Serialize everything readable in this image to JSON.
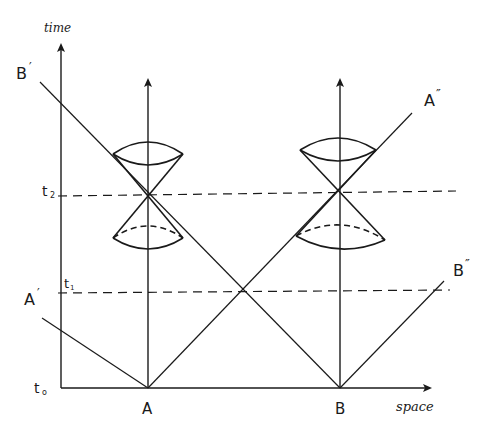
{
  "diagram": {
    "axes": {
      "time_label": "time",
      "space_label": "space"
    },
    "time_ticks": [
      {
        "label": "t",
        "sub": "o",
        "y": 388
      },
      {
        "label": "t",
        "sub": "1",
        "y": 293
      },
      {
        "label": "t",
        "sub": "2",
        "y": 196
      }
    ],
    "points": [
      {
        "label": "A",
        "x": 148
      },
      {
        "label": "B",
        "x": 340
      }
    ],
    "ray_labels": {
      "b_prime": "B",
      "b_prime_mark": "′",
      "a_prime": "A",
      "a_prime_mark": "′",
      "a_double_prime": "A",
      "a_double_prime_mark": "″",
      "b_double_prime": "B",
      "b_double_prime_mark": "″"
    },
    "colors": {
      "ink": "#1a1a1a",
      "background": "#ffffff"
    }
  }
}
